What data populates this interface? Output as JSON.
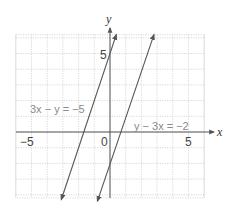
{
  "chart_data": {
    "type": "line",
    "title": "",
    "xlabel": "x",
    "ylabel": "y",
    "xlim": [
      -6,
      6
    ],
    "ylim": [
      -4.2,
      6.2
    ],
    "grid": true,
    "x_tick_labels": [
      "-5",
      "0",
      "5"
    ],
    "y_tick_labels": [
      "5"
    ],
    "series": [
      {
        "name": "3x − y = −5",
        "equation": "y = 3x + 5",
        "slope": 3,
        "intercept": 5,
        "points": [
          [
            -3.1,
            -4.3
          ],
          [
            0.4,
            6.2
          ]
        ],
        "arrows": "both"
      },
      {
        "name": "y − 3x = −2",
        "equation": "y = 3x - 2",
        "slope": 3,
        "intercept": -2,
        "points": [
          [
            -0.8,
            -4.4
          ],
          [
            2.8,
            6.2
          ]
        ],
        "arrows": "both"
      }
    ],
    "annotations": [
      {
        "text": "3x − y = −5",
        "x": -5.6,
        "y": 1.8
      },
      {
        "text": "y − 3x = −2",
        "x": 1.5,
        "y": 0.4
      }
    ]
  },
  "labels": {
    "x_axis": "x",
    "y_axis": "y",
    "tick_neg5": "−5",
    "tick_0": "0",
    "tick_5x": "5",
    "tick_5y": "5",
    "eq1": "3x − y = −5",
    "eq2": "y − 3x = −2"
  },
  "colors": {
    "grid": "#c8c8c8",
    "axis": "#555555",
    "line": "#555555",
    "equation_text": "#8a8a8a"
  }
}
